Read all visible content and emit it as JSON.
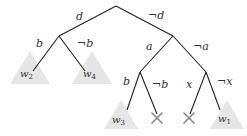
{
  "diagram": {
    "type": "decision-tree",
    "edge_labels": {
      "root_left": "d",
      "root_right": "¬d",
      "d_left": "b",
      "d_right": "¬b",
      "nd_left": "a",
      "nd_right": "¬a",
      "a_left": "b",
      "a_right": "¬b",
      "na_left": "x",
      "na_right": "¬x"
    },
    "leaves": [
      {
        "name": "w",
        "sub": "2"
      },
      {
        "name": "w",
        "sub": "4"
      },
      {
        "name": "w",
        "sub": "3"
      },
      {
        "name": "cross"
      },
      {
        "name": "cross"
      },
      {
        "name": "w",
        "sub": "1"
      }
    ],
    "colors": {
      "edge": "#222222",
      "leaf_triangle": "#e6e6e6",
      "cross": "#888888"
    }
  }
}
